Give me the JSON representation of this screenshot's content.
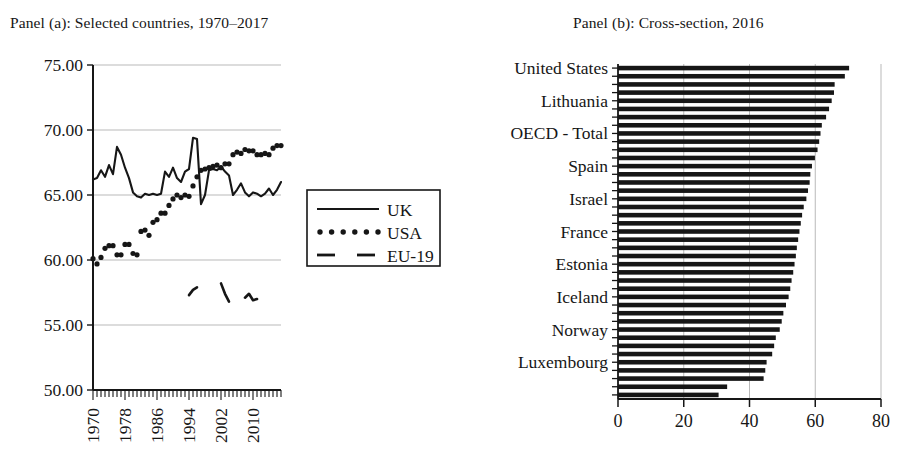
{
  "figure": {
    "background": "#ffffff",
    "ink": "#161616",
    "gridline_color": "#b9b9b9"
  },
  "panel_a": {
    "title": "Panel (a): Selected countries, 1970–2017",
    "legend": {
      "entries": [
        {
          "label": "UK",
          "style": "solid"
        },
        {
          "label": "USA",
          "style": "dotted"
        },
        {
          "label": "EU-19",
          "style": "dashed"
        }
      ]
    }
  },
  "panel_b": {
    "title": "Panel (b): Cross-section, 2016"
  },
  "chart_data": [
    {
      "id": "panel-a",
      "type": "line",
      "title": "Panel (a): Selected countries, 1970–2017",
      "xlabel": "",
      "ylabel": "",
      "xlim": [
        1970,
        2017
      ],
      "ylim": [
        50,
        75
      ],
      "yticks": [
        50,
        55,
        60,
        65,
        70,
        75
      ],
      "ytick_labels": [
        "50.00",
        "55.00",
        "60.00",
        "65.00",
        "70.00",
        "75.00"
      ],
      "xticks": [
        1970,
        1978,
        1986,
        1994,
        2002,
        2010
      ],
      "xtick_labels": [
        "1970",
        "1978",
        "1986",
        "1994",
        "2002",
        "2010"
      ],
      "xtick_rotation": 90,
      "minor_xticks_every": 1,
      "grid": "horizontal",
      "legend_position": "right-outside",
      "series": [
        {
          "name": "UK",
          "style": "solid",
          "x": [
            1970,
            1971,
            1972,
            1973,
            1974,
            1975,
            1976,
            1977,
            1978,
            1979,
            1980,
            1981,
            1982,
            1983,
            1984,
            1985,
            1986,
            1987,
            1988,
            1989,
            1990,
            1991,
            1992,
            1993,
            1994,
            1995,
            1996,
            1997,
            1998,
            1999,
            2000,
            2001,
            2002,
            2003,
            2004,
            2005,
            2006,
            2007,
            2008,
            2009,
            2010,
            2011,
            2012,
            2013,
            2014,
            2015,
            2016,
            2017
          ],
          "values": [
            66.2,
            66.3,
            66.9,
            66.4,
            67.3,
            66.6,
            68.7,
            68.1,
            67.1,
            66.3,
            65.2,
            64.9,
            64.8,
            65.1,
            65.0,
            65.1,
            65.0,
            65.1,
            66.8,
            66.4,
            67.1,
            66.3,
            66.0,
            66.8,
            67.0,
            69.4,
            69.3,
            64.3,
            65.0,
            66.9,
            67.0,
            66.9,
            67.2,
            66.8,
            66.5,
            65.0,
            65.4,
            65.9,
            65.2,
            64.9,
            65.2,
            65.1,
            64.9,
            65.1,
            65.5,
            65.0,
            65.4,
            66.0
          ]
        },
        {
          "name": "USA",
          "style": "dotted",
          "x": [
            1970,
            1971,
            1972,
            1973,
            1974,
            1975,
            1976,
            1977,
            1978,
            1979,
            1980,
            1981,
            1982,
            1983,
            1984,
            1985,
            1986,
            1987,
            1988,
            1989,
            1990,
            1991,
            1992,
            1993,
            1994,
            1995,
            1996,
            1997,
            1998,
            1999,
            2000,
            2001,
            2002,
            2003,
            2004,
            2005,
            2006,
            2007,
            2008,
            2009,
            2010,
            2011,
            2012,
            2013,
            2014,
            2015,
            2016,
            2017
          ],
          "values": [
            60.1,
            59.7,
            60.2,
            60.9,
            61.1,
            61.1,
            60.4,
            60.4,
            61.2,
            61.2,
            60.5,
            60.4,
            62.2,
            62.3,
            61.9,
            62.9,
            63.1,
            63.6,
            63.6,
            64.2,
            64.7,
            65.0,
            64.8,
            65.0,
            64.9,
            65.7,
            66.4,
            66.9,
            67.0,
            67.1,
            67.2,
            67.3,
            67.1,
            67.4,
            67.4,
            68.1,
            68.3,
            68.2,
            68.5,
            68.4,
            68.4,
            68.1,
            68.1,
            68.2,
            68.1,
            68.6,
            68.8,
            68.8
          ]
        },
        {
          "name": "EU-19",
          "style": "dashed",
          "x": [
            1994,
            1995,
            1996,
            2002,
            2003,
            2004,
            2008,
            2009,
            2010,
            2011
          ],
          "values": [
            57.3,
            57.7,
            57.9,
            58.2,
            57.4,
            56.8,
            57.1,
            57.4,
            56.9,
            57.0
          ]
        }
      ]
    },
    {
      "id": "panel-b",
      "type": "bar",
      "orientation": "horizontal",
      "title": "Panel (b): Cross-section, 2016",
      "xlabel": "",
      "ylabel": "",
      "xlim": [
        0,
        80
      ],
      "xticks": [
        0,
        20,
        40,
        60,
        80
      ],
      "xtick_labels": [
        "0",
        "20",
        "40",
        "60",
        "80"
      ],
      "grid": "vertical",
      "labelled_categories": [
        "United States",
        "Lithuania",
        "OECD - Total",
        "Spain",
        "Israel",
        "France",
        "Estonia",
        "Iceland",
        "Norway",
        "Luxembourg"
      ],
      "label_every_n_bars": 4,
      "values": [
        70.3,
        69.0,
        65.9,
        65.7,
        65.0,
        64.2,
        63.3,
        62.0,
        61.6,
        61.2,
        60.7,
        59.9,
        59.0,
        58.5,
        58.3,
        57.8,
        57.3,
        56.5,
        56.0,
        55.6,
        55.2,
        54.8,
        54.4,
        54.1,
        53.7,
        53.3,
        52.8,
        52.4,
        51.9,
        51.1,
        50.3,
        49.8,
        49.2,
        48.0,
        47.5,
        46.9,
        45.2,
        44.8,
        44.3,
        33.2,
        30.6
      ]
    }
  ]
}
